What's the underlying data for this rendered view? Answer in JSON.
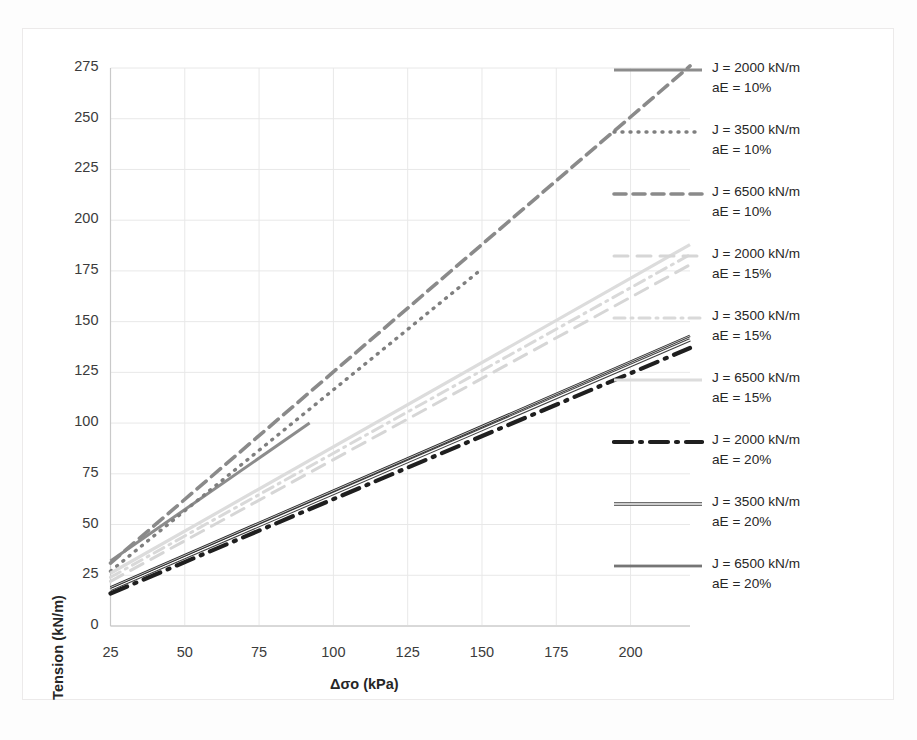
{
  "chart_data": {
    "type": "line",
    "title": "",
    "xlabel": "Δσo (kPa)",
    "ylabel": "Tension (kN/m)",
    "xlim": [
      25,
      220
    ],
    "ylim": [
      0,
      275
    ],
    "xticks": [
      25,
      50,
      75,
      100,
      125,
      150,
      175,
      200
    ],
    "yticks": [
      0,
      25,
      50,
      75,
      100,
      125,
      150,
      175,
      200,
      225,
      250,
      275
    ],
    "grid": true,
    "legend_position": "right",
    "series": [
      {
        "name": "J = 2000 kN/m aE = 10%",
        "label_line1": "J = 2000 kN/m",
        "label_line2": "aE = 10%",
        "J": 2000,
        "aE": "10%",
        "style": "solid",
        "color": "#8c8c8c",
        "width": 3.0,
        "dash": "none",
        "x": [
          25,
          92
        ],
        "y": [
          32,
          100
        ]
      },
      {
        "name": "J = 3500 kN/m aE = 10%",
        "label_line1": "J = 3500 kN/m",
        "label_line2": "aE = 10%",
        "J": 3500,
        "aE": "10%",
        "style": "dotted",
        "color": "#7f7f7f",
        "width": 3.4,
        "dash": "1,7",
        "x": [
          25,
          150
        ],
        "y": [
          27,
          176
        ]
      },
      {
        "name": "J = 6500 kN/m aE = 10%",
        "label_line1": "J = 6500 kN/m",
        "label_line2": "aE = 10%",
        "J": 6500,
        "aE": "10%",
        "style": "dashed",
        "color": "#8a8a8a",
        "width": 3.6,
        "dash": "12,7",
        "x": [
          25,
          220
        ],
        "y": [
          31,
          276
        ]
      },
      {
        "name": "J = 2000 kN/m aE = 15%",
        "label_line1": "J = 2000 kN/m",
        "label_line2": "aE = 15%",
        "J": 2000,
        "aE": "15%",
        "style": "dashed-light",
        "color": "#d6d6d6",
        "width": 3.0,
        "dash": "14,9",
        "x": [
          25,
          220
        ],
        "y": [
          22,
          178
        ]
      },
      {
        "name": "J = 3500 kN/m aE = 15%",
        "label_line1": "J = 3500 kN/m",
        "label_line2": "aE = 15%",
        "J": 3500,
        "aE": "15%",
        "style": "dashdot-light",
        "color": "#d9d9d9",
        "width": 3.0,
        "dash": "11,6,2,6",
        "x": [
          25,
          220
        ],
        "y": [
          24,
          183
        ]
      },
      {
        "name": "J = 6500 kN/m aE = 15%",
        "label_line1": "J = 6500 kN/m",
        "label_line2": "aE = 15%",
        "J": 6500,
        "aE": "15%",
        "style": "solid-light",
        "color": "#dcdcdc",
        "width": 3.2,
        "dash": "none",
        "x": [
          25,
          220
        ],
        "y": [
          26,
          188
        ]
      },
      {
        "name": "J = 2000 kN/m aE = 20%",
        "label_line1": "J = 2000 kN/m",
        "label_line2": "aE = 20%",
        "J": 2000,
        "aE": "20%",
        "style": "dashdot-dark",
        "color": "#1f1f1f",
        "width": 4.2,
        "dash": "18,8,2,8",
        "x": [
          25,
          220
        ],
        "y": [
          16,
          137
        ]
      },
      {
        "name": "J = 3500 kN/m aE = 20%",
        "label_line1": "J = 3500 kN/m",
        "label_line2": "aE = 20%",
        "J": 3500,
        "aE": "20%",
        "style": "dashdot-medium",
        "color": "#3f3f3f",
        "width": 3.4,
        "dash": "none",
        "x": [
          25,
          220
        ],
        "y": [
          18,
          141
        ]
      },
      {
        "name": "J = 6500 kN/m aE = 20%",
        "label_line1": "J = 6500 kN/m",
        "label_line2": "aE = 20%",
        "J": 6500,
        "aE": "20%",
        "style": "solid-dark",
        "color": "#2b2b2b",
        "width": 2.6,
        "dash": "none",
        "x": [
          25,
          220
        ],
        "y": [
          19,
          143
        ]
      }
    ]
  },
  "axes": {
    "x_label": "Δσo (kPa)",
    "y_label": "Tension (kN/m)",
    "x_tick_labels": [
      "25",
      "50",
      "75",
      "100",
      "125",
      "150",
      "175",
      "200"
    ],
    "y_tick_labels": [
      "0",
      "25",
      "50",
      "75",
      "100",
      "125",
      "150",
      "175",
      "200",
      "225",
      "250",
      "275"
    ]
  },
  "legend": {
    "items": [
      {
        "line1": "J = 2000 kN/m",
        "line2": "aE = 10%"
      },
      {
        "line1": "J = 3500 kN/m",
        "line2": "aE = 10%"
      },
      {
        "line1": "J = 6500 kN/m",
        "line2": "aE = 10%"
      },
      {
        "line1": "J = 2000 kN/m",
        "line2": "aE = 15%"
      },
      {
        "line1": "J = 3500 kN/m",
        "line2": "aE = 15%"
      },
      {
        "line1": "J = 6500 kN/m",
        "line2": "aE = 15%"
      },
      {
        "line1": "J = 2000 kN/m",
        "line2": "aE = 20%"
      },
      {
        "line1": "J = 3500 kN/m",
        "line2": "aE = 20%"
      },
      {
        "line1": "J = 6500 kN/m",
        "line2": "aE = 20%"
      }
    ]
  },
  "colors": {
    "grid": "#e8e8e8",
    "axis": "#d0d0d0",
    "text": "#262626",
    "frame": "#eceaea"
  }
}
